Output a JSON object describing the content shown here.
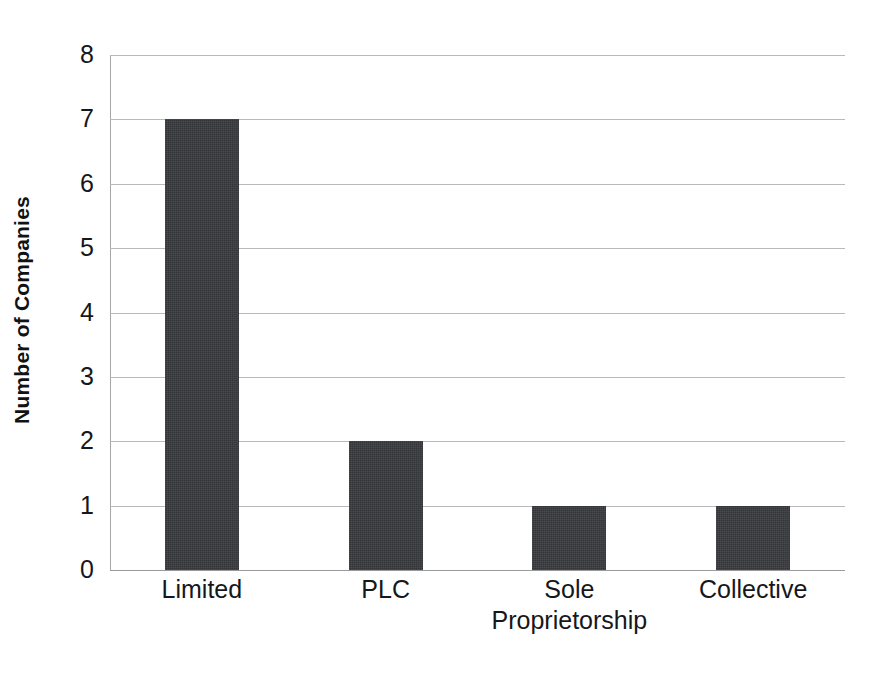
{
  "chart_data": {
    "type": "bar",
    "title": "",
    "xlabel": "",
    "ylabel": "Number of Companies",
    "categories": [
      "Limited",
      "PLC",
      "Sole Proprietorship",
      "Collective"
    ],
    "category_lines": [
      [
        "Limited"
      ],
      [
        "PLC"
      ],
      [
        "Sole",
        "Proprietorship"
      ],
      [
        "Collective"
      ]
    ],
    "values": [
      7,
      2,
      1,
      1
    ],
    "ylim": [
      0,
      8
    ],
    "y_ticks": [
      "8",
      "7",
      "6",
      "5",
      "4",
      "3",
      "2",
      "1",
      "0"
    ],
    "y_tick_values": [
      8,
      7,
      6,
      5,
      4,
      3,
      2,
      1,
      0
    ],
    "grid": true,
    "legend": "none",
    "bar_color": "#343539",
    "gridline_color": "#b9b9bd",
    "axis_color": "#a8a8ac",
    "background_color": "#ffffff",
    "text_color": "#16171a"
  }
}
